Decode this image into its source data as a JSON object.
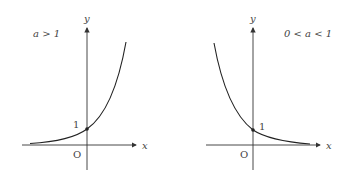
{
  "panels": [
    {
      "condition": "a > 1",
      "y_label": "y",
      "x_label": "x",
      "origin_label": "O",
      "intercept_label": "1",
      "curve": "increasing exponential"
    },
    {
      "condition": "0 < a < 1",
      "y_label": "y",
      "x_label": "x",
      "origin_label": "O",
      "intercept_label": "1",
      "curve": "decreasing exponential"
    }
  ],
  "colors": {
    "axis": "#333333",
    "curve": "#222222",
    "text": "#444444"
  }
}
